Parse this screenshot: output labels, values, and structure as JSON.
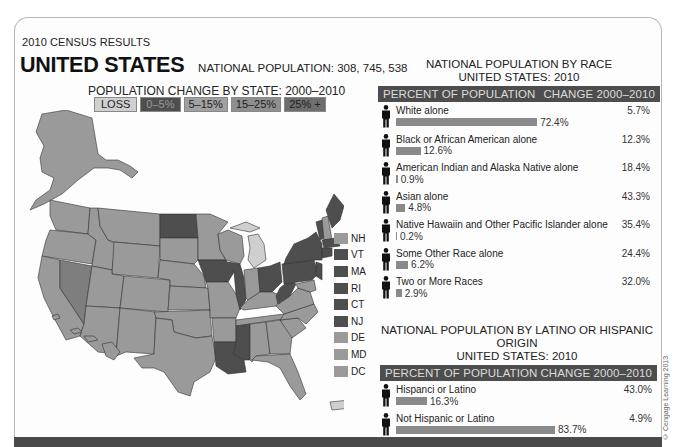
{
  "header": {
    "kicker": "2010 CENSUS RESULTS",
    "title": "UNITED STATES",
    "population_label": "NATIONAL POPULATION: 308, 745, 538"
  },
  "map": {
    "title": "POPULATION CHANGE BY STATE: 2000–2010",
    "legend": [
      {
        "label": "LOSS",
        "color": "#d0d0d0"
      },
      {
        "label": "0–5%",
        "color": "#4e4e4e"
      },
      {
        "label": "5–15%",
        "color": "#a0a0a0"
      },
      {
        "label": "15–25%",
        "color": "#8f8f8f"
      },
      {
        "label": "25% +",
        "color": "#6e6e6e"
      }
    ],
    "small_states": [
      {
        "label": "NH",
        "color": "#9a9a9a"
      },
      {
        "label": "VT",
        "color": "#4e4e4e"
      },
      {
        "label": "MA",
        "color": "#4e4e4e"
      },
      {
        "label": "RI",
        "color": "#4e4e4e"
      },
      {
        "label": "CT",
        "color": "#4e4e4e"
      },
      {
        "label": "NJ",
        "color": "#4e4e4e"
      },
      {
        "label": "DE",
        "color": "#9a9a9a"
      },
      {
        "label": "MD",
        "color": "#9a9a9a"
      },
      {
        "label": "DC",
        "color": "#9a9a9a"
      }
    ]
  },
  "race_panel": {
    "title_line1": "NATIONAL POPULATION BY RACE",
    "title_line2": "UNITED STATES: 2010",
    "col_left": "PERCENT OF POPULATION",
    "col_right": "CHANGE 2000–2010",
    "rows": [
      {
        "label": "White alone",
        "percent": "72.4%",
        "change": "5.7%"
      },
      {
        "label": "Black or African American alone",
        "percent": "12.6%",
        "change": "12.3%"
      },
      {
        "label": "American Indian and Alaska Native alone",
        "percent": "0.9%",
        "change": "18.4%"
      },
      {
        "label": "Asian alone",
        "percent": "4.8%",
        "change": "43.3%"
      },
      {
        "label": "Native Hawaiin and Other Pacific Islander alone",
        "percent": "0.2%",
        "change": "35.4%"
      },
      {
        "label": "Some Other Race alone",
        "percent": "6.2%",
        "change": "24.4%"
      },
      {
        "label": "Two or More Races",
        "percent": "2.9%",
        "change": "32.0%"
      }
    ]
  },
  "hispanic_panel": {
    "title_line1": "NATIONAL POPULATION BY LATINO OR HISPANIC ORIGIN",
    "title_line2": "UNITED STATES: 2010",
    "col_left": "PERCENT OF POPULATION",
    "col_right": "CHANGE 2000–2010",
    "rows": [
      {
        "label": "Hispanci or Latino",
        "percent": "16.3%",
        "change": "43.0%"
      },
      {
        "label": "Not Hispanic or Latino",
        "percent": "83.7%",
        "change": "4.9%"
      }
    ]
  },
  "credit": "© Cengage Learning 2013",
  "chart_data": [
    {
      "type": "bar",
      "title": "NATIONAL POPULATION BY RACE — UNITED STATES: 2010",
      "orientation": "horizontal",
      "categories": [
        "White alone",
        "Black or African American alone",
        "American Indian and Alaska Native alone",
        "Asian alone",
        "Native Hawaiin and Other Pacific Islander alone",
        "Some Other Race alone",
        "Two or More Races"
      ],
      "series": [
        {
          "name": "Percent of population",
          "values": [
            72.4,
            12.6,
            0.9,
            4.8,
            0.2,
            6.2,
            2.9
          ]
        },
        {
          "name": "Change 2000–2010",
          "values": [
            5.7,
            12.3,
            18.4,
            43.3,
            35.4,
            24.4,
            32.0
          ]
        }
      ],
      "xlabel": "",
      "ylabel": ""
    },
    {
      "type": "bar",
      "title": "NATIONAL POPULATION BY LATINO OR HISPANIC ORIGIN — UNITED STATES: 2010",
      "orientation": "horizontal",
      "categories": [
        "Hispanci or Latino",
        "Not Hispanic or Latino"
      ],
      "series": [
        {
          "name": "Percent of population",
          "values": [
            16.3,
            83.7
          ]
        },
        {
          "name": "Change 2000–2010",
          "values": [
            43.0,
            4.9
          ]
        }
      ]
    },
    {
      "type": "choropleth",
      "title": "POPULATION CHANGE BY STATE: 2000–2010",
      "legend": [
        "LOSS",
        "0–5%",
        "5–15%",
        "15–25%",
        "25% +"
      ],
      "highlighted_0_5": [
        "ND",
        "IA",
        "IL",
        "MS",
        "LA",
        "OH",
        "WV",
        "PA",
        "NY",
        "VT",
        "ME",
        "MA",
        "RI",
        "CT",
        "NJ"
      ],
      "loss": [
        "MI",
        "PR"
      ],
      "range_25_plus": [
        "NV"
      ]
    }
  ]
}
